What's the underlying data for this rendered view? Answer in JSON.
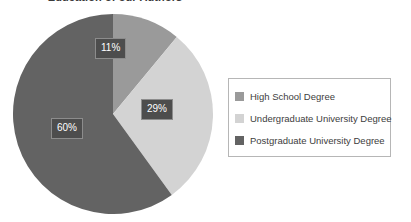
{
  "chart_data": {
    "type": "pie",
    "title": "Education of our Authors",
    "xlabel": "",
    "ylabel": "",
    "legend_position": "right",
    "grid": false,
    "start_angle_deg": 0,
    "direction": "clockwise",
    "categories": [
      "High School Degree",
      "Undergraduate University Degree",
      "Postgraduate University Degree"
    ],
    "values": [
      11,
      29,
      60
    ],
    "value_labels": [
      "11%",
      "29%",
      "60%"
    ],
    "colors": [
      "#9a9a9a",
      "#d3d3d3",
      "#636363"
    ],
    "slices": [
      {
        "label": "High School Degree",
        "value": 11,
        "display": "11%",
        "color": "#9a9a9a"
      },
      {
        "label": "Undergraduate University Degree",
        "value": 29,
        "display": "29%",
        "color": "#d3d3d3"
      },
      {
        "label": "Postgraduate University Degree",
        "value": 60,
        "display": "60%",
        "color": "#636363"
      }
    ]
  },
  "labels": {
    "slice_0": "11%",
    "slice_1": "29%",
    "slice_2": "60%"
  },
  "legend": {
    "items": [
      {
        "label": "High School Degree",
        "color": "#9a9a9a"
      },
      {
        "label": "Undergraduate University Degree",
        "color": "#d3d3d3"
      },
      {
        "label": "Postgraduate University Degree",
        "color": "#636363"
      }
    ]
  },
  "style": {
    "background": "#ffffff",
    "label_box_bg": "#4d4d4d",
    "label_box_text": "#ffffff",
    "legend_border": "#b6b6b6"
  }
}
